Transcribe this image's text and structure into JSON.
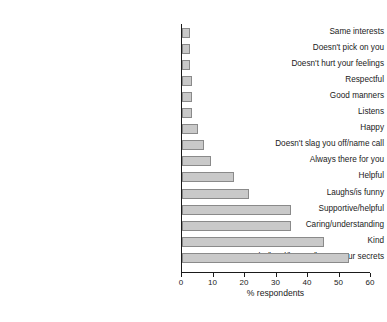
{
  "chart_data": {
    "type": "bar",
    "orientation": "horizontal",
    "title": "",
    "subtitle": "",
    "xlabel": "% respondents",
    "ylabel": "",
    "xlim": [
      0,
      60
    ],
    "xticks": [
      0,
      10,
      20,
      30,
      40,
      50,
      60
    ],
    "xtick_labels": [
      "0",
      "10",
      "20",
      "30",
      "40",
      "50",
      "60"
    ],
    "grid": false,
    "legend": false,
    "legend_position": "none",
    "bar_color": "#c9c9c9",
    "bar_edge_color": "#8a8a8a",
    "axis_color": "#1a1a1a",
    "categories": [
      "Same interests",
      "Doesn't pick on you",
      "Doesn't hurt your feelings",
      "Respectful",
      "Good manners",
      "Listens",
      "Happy",
      "Doesn't slag you off/name call",
      "Always there for you",
      "Helpful",
      "Laughs/is funny",
      "Supportive/helpful",
      "Caring/understanding",
      "Kind",
      "Trustworthy/loyal/honest/keeps your secrets"
    ],
    "values": [
      2.5,
      2.5,
      2.5,
      3.3,
      3.3,
      3.3,
      5.0,
      7.0,
      9.3,
      16.5,
      21.3,
      34.5,
      34.5,
      45.2,
      53.0
    ]
  },
  "axis": {
    "x_title": "% respondents"
  }
}
